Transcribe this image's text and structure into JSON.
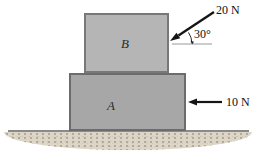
{
  "figure": {
    "type": "physics-force-diagram",
    "blocks": {
      "top": {
        "label": "B"
      },
      "bottom": {
        "label": "A"
      }
    },
    "forces": {
      "angled": {
        "label": "20 N",
        "angle": "30°",
        "applied_to": "B",
        "direction": "down-left at 30 degrees above horizontal"
      },
      "horizontal": {
        "label": "10 N",
        "applied_to": "A",
        "direction": "left"
      }
    },
    "colors": {
      "block_b_fill": "#b5b5b5",
      "block_b_border": "#787878",
      "block_a_fill": "#a7a7a7",
      "block_a_border": "#6c6c6c",
      "arrow": "#151515",
      "reference_line": "#9a9a9a",
      "ground_line": "#8a8a8a",
      "ground_sand": "#ddd6c8",
      "background": "#ffffff"
    }
  }
}
